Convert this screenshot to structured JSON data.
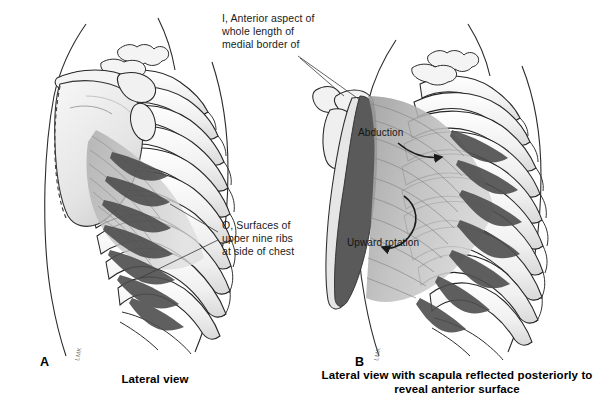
{
  "figure": {
    "background_color": "#ffffff",
    "ink_color": "#1a1a1a",
    "muscle_fill": "#b9b9b9",
    "muscle_dark": "#5a5a5a",
    "bone_fill": "#f2f2f2",
    "scapula_fill": "#ededed",
    "medial_border_color": "#555555"
  },
  "callouts": {
    "insertion": {
      "marker": "I,",
      "text": "I, Anterior aspect of\nwhole length of\nmedial border of",
      "lines": [
        "I, Anterior aspect of",
        "whole length of",
        "medial border of"
      ]
    },
    "origin": {
      "marker": "O,",
      "text": "O, Surfaces of\nupper nine ribs\nat side of chest",
      "lines": [
        "O, Surfaces of",
        "upper nine ribs",
        "at side of chest"
      ]
    }
  },
  "in_figure_labels": {
    "abduction": "Abduction",
    "upward_rotation": "Upward rotation"
  },
  "panels": [
    {
      "letter": "A",
      "caption": "Lateral view",
      "signature": "LMK"
    },
    {
      "letter": "B",
      "caption_line1": "Lateral view with scapula reflected posteriorly",
      "caption_line2": "to reveal anterior surface",
      "signature": "LMK"
    }
  ]
}
